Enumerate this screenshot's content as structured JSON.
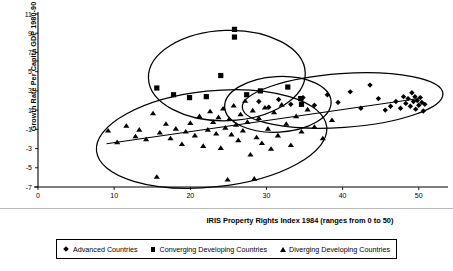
{
  "chart_data": {
    "type": "scatter",
    "title": "",
    "xlabel": "IRIS Property Rights Index 1984 (ranges from 0 to 50)",
    "ylabel": "Growth Rate Per Capita GDP 1980-90",
    "xlim": [
      0,
      52
    ],
    "ylim": [
      -7,
      11
    ],
    "xticks": [
      0,
      10,
      20,
      30,
      40,
      50
    ],
    "yticks": [
      -7,
      -5,
      -3,
      -1,
      1,
      3,
      5,
      7,
      9,
      11
    ],
    "grid": false,
    "legend_position": "bottom",
    "series": [
      {
        "name": "Advanced Countries",
        "marker": "diamond",
        "color": "#000000",
        "points": [
          [
            29.0,
            1.9
          ],
          [
            30.3,
            1.3
          ],
          [
            31.6,
            2.1
          ],
          [
            33.2,
            1.6
          ],
          [
            34.8,
            2.3
          ],
          [
            36.3,
            1.5
          ],
          [
            38.0,
            2.6
          ],
          [
            39.4,
            1.8
          ],
          [
            41.0,
            2.9
          ],
          [
            42.4,
            1.2
          ],
          [
            43.6,
            3.6
          ],
          [
            44.7,
            2.2
          ],
          [
            45.6,
            1.0
          ],
          [
            46.3,
            1.4
          ],
          [
            47.0,
            1.9
          ],
          [
            47.6,
            1.2
          ],
          [
            48.0,
            2.4
          ],
          [
            48.3,
            1.7
          ],
          [
            48.6,
            2.2
          ],
          [
            48.9,
            1.4
          ],
          [
            49.1,
            2.8
          ],
          [
            49.3,
            1.9
          ],
          [
            49.5,
            2.4
          ],
          [
            49.6,
            1.1
          ],
          [
            49.8,
            2.0
          ],
          [
            50.0,
            1.5
          ],
          [
            50.2,
            2.3
          ],
          [
            50.4,
            1.8
          ],
          [
            50.6,
            0.9
          ],
          [
            50.8,
            1.6
          ]
        ]
      },
      {
        "name": "Converging Developing Countries",
        "marker": "square",
        "color": "#000000",
        "points": [
          [
            15.6,
            3.3
          ],
          [
            17.8,
            2.6
          ],
          [
            19.9,
            2.3
          ],
          [
            22.1,
            2.4
          ],
          [
            24.0,
            4.6
          ],
          [
            25.8,
            8.6
          ],
          [
            25.8,
            9.4
          ],
          [
            27.4,
            2.6
          ],
          [
            29.2,
            3.0
          ],
          [
            32.8,
            3.4
          ],
          [
            34.5,
            2.2
          ],
          [
            34.6,
            1.6
          ]
        ]
      },
      {
        "name": "Diverging Developing Countries",
        "marker": "triangle",
        "color": "#000000",
        "points": [
          [
            9.2,
            -1.1
          ],
          [
            10.4,
            -2.3
          ],
          [
            11.6,
            -0.6
          ],
          [
            12.8,
            -1.7
          ],
          [
            13.3,
            -1.0
          ],
          [
            14.2,
            -2.0
          ],
          [
            15.1,
            0.7
          ],
          [
            15.6,
            -5.9
          ],
          [
            16.0,
            -1.3
          ],
          [
            16.8,
            -0.4
          ],
          [
            17.4,
            -1.9
          ],
          [
            18.1,
            -0.9
          ],
          [
            18.9,
            -2.5
          ],
          [
            19.4,
            -1.2
          ],
          [
            20.0,
            -0.3
          ],
          [
            20.6,
            -1.6
          ],
          [
            21.2,
            0.4
          ],
          [
            21.7,
            -2.7
          ],
          [
            22.3,
            -1.0
          ],
          [
            22.6,
            0.9
          ],
          [
            23.0,
            -0.2
          ],
          [
            23.4,
            -1.4
          ],
          [
            23.7,
            0.3
          ],
          [
            24.0,
            -2.9
          ],
          [
            24.3,
            1.2
          ],
          [
            24.6,
            -0.8
          ],
          [
            24.9,
            -6.2
          ],
          [
            25.1,
            0.1
          ],
          [
            25.4,
            -1.5
          ],
          [
            25.7,
            1.5
          ],
          [
            26.0,
            -0.5
          ],
          [
            26.3,
            -2.1
          ],
          [
            26.6,
            0.6
          ],
          [
            26.9,
            -1.1
          ],
          [
            27.2,
            2.0
          ],
          [
            27.5,
            -0.2
          ],
          [
            27.9,
            -3.6
          ],
          [
            28.2,
            1.0
          ],
          [
            28.4,
            -6.1
          ],
          [
            28.7,
            -1.8
          ],
          [
            29.0,
            0.2
          ],
          [
            29.4,
            -2.4
          ],
          [
            29.8,
            1.3
          ],
          [
            30.2,
            -0.9
          ],
          [
            30.6,
            -3.0
          ],
          [
            31.0,
            0.8
          ],
          [
            31.5,
            -1.6
          ],
          [
            32.0,
            1.6
          ],
          [
            32.6,
            -0.4
          ],
          [
            33.2,
            -2.6
          ],
          [
            33.9,
            0.4
          ],
          [
            34.6,
            -1.2
          ],
          [
            35.4,
            1.1
          ],
          [
            36.3,
            -0.7
          ],
          [
            37.4,
            -1.9
          ],
          [
            38.6,
            0.0
          ]
        ]
      }
    ],
    "trend_line": {
      "x0": 9.0,
      "y0": -2.5,
      "x1": 50.0,
      "y1": 2.2
    },
    "group_ellipses": [
      {
        "label": "converging-group",
        "cx": 24.8,
        "cy": 4.6,
        "rx": 10.3,
        "ry": 4.7,
        "rot": -2
      },
      {
        "label": "diverging-group",
        "cx": 22.8,
        "cy": -2.0,
        "rx": 15.2,
        "ry": 5.0,
        "rot": -6
      },
      {
        "label": "mixed-core-group",
        "cx": 31.5,
        "cy": 1.6,
        "rx": 7.0,
        "ry": 2.9,
        "rot": -3
      },
      {
        "label": "advanced-group",
        "cx": 40.0,
        "cy": 2.0,
        "rx": 13.2,
        "ry": 2.8,
        "rot": -4
      }
    ]
  }
}
